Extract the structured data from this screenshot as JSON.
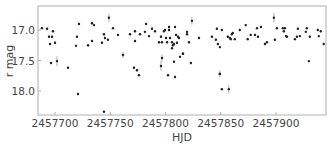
{
  "chart_data": {
    "type": "scatter",
    "title": "",
    "xlabel": "HJD",
    "ylabel": "r mag",
    "xlim": [
      2457685,
      2457948
    ],
    "ylim": [
      18.39,
      16.61
    ],
    "y_inverted": true,
    "grid": false,
    "legend": null,
    "xticks": [
      2457700,
      2457750,
      2457800,
      2457850,
      2457900
    ],
    "xtick_labels": [
      "2457700",
      "2457750",
      "2457800",
      "2457850",
      "2457900"
    ],
    "yticks": [
      17.0,
      17.5,
      18.0
    ],
    "ytick_labels": [
      "17.0",
      "17.5",
      "18.0"
    ],
    "marker_color": "#222222",
    "errorbar_color": "#999999",
    "series": [
      {
        "name": "r-band photometry",
        "points": [
          {
            "x": 2457688.2,
            "y": 16.97
          },
          {
            "x": 2457692.8,
            "y": 16.98
          },
          {
            "x": 2457694.6,
            "y": 17.11
          },
          {
            "x": 2457697.3,
            "y": 17.11
          },
          {
            "x": 2457698.2,
            "y": 17.02
          },
          {
            "x": 2457695.5,
            "y": 17.23
          },
          {
            "x": 2457700.0,
            "y": 17.21
          },
          {
            "x": 2457696.4,
            "y": 17.54
          },
          {
            "x": 2457701.8,
            "y": 17.51,
            "err": 0.08
          },
          {
            "x": 2457711.8,
            "y": 17.62
          },
          {
            "x": 2457721.7,
            "y": 16.9
          },
          {
            "x": 2457719.9,
            "y": 17.11
          },
          {
            "x": 2457719.0,
            "y": 17.26
          },
          {
            "x": 2457720.8,
            "y": 18.05
          },
          {
            "x": 2457733.5,
            "y": 16.89
          },
          {
            "x": 2457735.3,
            "y": 16.92
          },
          {
            "x": 2457729.9,
            "y": 17.25
          },
          {
            "x": 2457733.5,
            "y": 17.18
          },
          {
            "x": 2457742.5,
            "y": 17.21
          },
          {
            "x": 2457744.3,
            "y": 17.07
          },
          {
            "x": 2457745.2,
            "y": 17.13
          },
          {
            "x": 2457747.9,
            "y": 17.16
          },
          {
            "x": 2457748.8,
            "y": 16.8,
            "err": 0.07
          },
          {
            "x": 2457744.3,
            "y": 18.34
          },
          {
            "x": 2457752.5,
            "y": 16.97
          },
          {
            "x": 2457757.0,
            "y": 17.08
          },
          {
            "x": 2457761.5,
            "y": 17.41,
            "err": 0.05
          },
          {
            "x": 2457767.9,
            "y": 17.07
          },
          {
            "x": 2457772.4,
            "y": 17.02
          },
          {
            "x": 2457772.4,
            "y": 17.18
          },
          {
            "x": 2457776.9,
            "y": 17.07
          },
          {
            "x": 2457781.4,
            "y": 17.03
          },
          {
            "x": 2457782.4,
            "y": 16.9
          },
          {
            "x": 2457785.1,
            "y": 17.1
          },
          {
            "x": 2457787.8,
            "y": 16.98
          },
          {
            "x": 2457790.5,
            "y": 17.02
          },
          {
            "x": 2457794.1,
            "y": 17.2
          },
          {
            "x": 2457795.9,
            "y": 17.11
          },
          {
            "x": 2457796.8,
            "y": 17.2
          },
          {
            "x": 2457798.6,
            "y": 17.02
          },
          {
            "x": 2457799.5,
            "y": 17.0
          },
          {
            "x": 2457800.5,
            "y": 17.13
          },
          {
            "x": 2457801.4,
            "y": 17.2
          },
          {
            "x": 2457803.2,
            "y": 17.0
          },
          {
            "x": 2457803.2,
            "y": 16.95
          },
          {
            "x": 2457796.8,
            "y": 17.46,
            "err": 0.06
          },
          {
            "x": 2457795.9,
            "y": 17.59,
            "err": 0.08
          },
          {
            "x": 2457804.1,
            "y": 17.13
          },
          {
            "x": 2457805.9,
            "y": 17.2
          },
          {
            "x": 2457806.8,
            "y": 17.25
          },
          {
            "x": 2457805.9,
            "y": 17.3
          },
          {
            "x": 2457807.7,
            "y": 17.23
          },
          {
            "x": 2457808.6,
            "y": 16.95
          },
          {
            "x": 2457809.5,
            "y": 17.08
          },
          {
            "x": 2457811.3,
            "y": 17.11
          },
          {
            "x": 2457812.2,
            "y": 17.13
          },
          {
            "x": 2457810.4,
            "y": 17.21
          },
          {
            "x": 2457813.1,
            "y": 17.44
          },
          {
            "x": 2457815.8,
            "y": 17.39
          },
          {
            "x": 2457807.7,
            "y": 17.52
          },
          {
            "x": 2457771.5,
            "y": 17.62
          },
          {
            "x": 2457774.2,
            "y": 17.66
          },
          {
            "x": 2457776.0,
            "y": 17.74
          },
          {
            "x": 2457802.3,
            "y": 17.74
          },
          {
            "x": 2457808.6,
            "y": 17.77
          },
          {
            "x": 2457823.9,
            "y": 16.85,
            "err": 0.06
          },
          {
            "x": 2457819.5,
            "y": 17.03
          },
          {
            "x": 2457819.5,
            "y": 17.07
          },
          {
            "x": 2457821.3,
            "y": 17.2
          },
          {
            "x": 2457830.3,
            "y": 17.13
          },
          {
            "x": 2457815.8,
            "y": 17.39
          },
          {
            "x": 2457823.0,
            "y": 17.54
          },
          {
            "x": 2457842.0,
            "y": 17.11
          },
          {
            "x": 2457845.6,
            "y": 17.16
          },
          {
            "x": 2457846.5,
            "y": 16.98
          },
          {
            "x": 2457851.0,
            "y": 17.0
          },
          {
            "x": 2457847.4,
            "y": 17.23
          },
          {
            "x": 2457849.2,
            "y": 17.28
          },
          {
            "x": 2457856.4,
            "y": 17.11
          },
          {
            "x": 2457858.2,
            "y": 17.13
          },
          {
            "x": 2457859.1,
            "y": 17.15
          },
          {
            "x": 2457860.0,
            "y": 17.07
          },
          {
            "x": 2457860.9,
            "y": 17.05
          },
          {
            "x": 2457862.7,
            "y": 17.15
          },
          {
            "x": 2457867.2,
            "y": 17.0
          },
          {
            "x": 2457872.6,
            "y": 16.92
          },
          {
            "x": 2457874.4,
            "y": 17.15
          },
          {
            "x": 2457877.1,
            "y": 17.08
          },
          {
            "x": 2457849.2,
            "y": 17.72,
            "err": 0.06
          },
          {
            "x": 2457857.3,
            "y": 17.97,
            "err": 0.07
          },
          {
            "x": 2457881.0,
            "y": 17.08
          },
          {
            "x": 2457882.8,
            "y": 16.97
          },
          {
            "x": 2457883.7,
            "y": 17.11
          },
          {
            "x": 2457886.4,
            "y": 16.95
          },
          {
            "x": 2457890.0,
            "y": 17.23
          },
          {
            "x": 2457891.8,
            "y": 17.2
          },
          {
            "x": 2457898.1,
            "y": 16.8,
            "err": 0.08
          },
          {
            "x": 2457899.0,
            "y": 17.16
          },
          {
            "x": 2457900.8,
            "y": 16.97
          },
          {
            "x": 2457906.2,
            "y": 16.97
          },
          {
            "x": 2457907.1,
            "y": 17.02
          },
          {
            "x": 2457908.0,
            "y": 16.97
          },
          {
            "x": 2457909.0,
            "y": 17.1
          },
          {
            "x": 2457909.9,
            "y": 17.11
          },
          {
            "x": 2457917.1,
            "y": 17.15
          },
          {
            "x": 2457918.9,
            "y": 17.11
          },
          {
            "x": 2457919.8,
            "y": 16.98
          },
          {
            "x": 2457921.6,
            "y": 17.1
          },
          {
            "x": 2457927.0,
            "y": 17.03
          },
          {
            "x": 2457927.9,
            "y": 16.97
          },
          {
            "x": 2457930.6,
            "y": 17.11
          },
          {
            "x": 2457929.7,
            "y": 17.51
          },
          {
            "x": 2457937.8,
            "y": 17.0
          },
          {
            "x": 2457938.7,
            "y": 17.1
          },
          {
            "x": 2457940.5,
            "y": 17.02
          },
          {
            "x": 2457943.2,
            "y": 17.23
          },
          {
            "x": 2457849.2,
            "y": 17.72
          },
          {
            "x": 2457851.0,
            "y": 17.97
          }
        ]
      }
    ]
  }
}
